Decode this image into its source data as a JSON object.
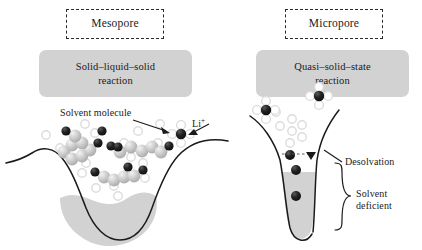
{
  "figure": {
    "colors": {
      "reaction_box_fill": "#d2d2d2",
      "pore_fill": "#d2d2d2",
      "outline": "#1a1a1a",
      "li_ion": "#1a1a1a",
      "solvent_ring": "#e8e8e8",
      "chain_sphere": "#c8c8c8",
      "background": "#ffffff"
    }
  },
  "panels": [
    {
      "id": "mesopore",
      "pore_label": "Mesopore",
      "reaction_label": "Solid–liquid–solid\nreaction",
      "reaction_line1": "Solid–liquid–solid",
      "reaction_line2": "reaction",
      "annotations": [
        {
          "name": "solvent-molecule",
          "text": "Solvent molecule"
        },
        {
          "name": "li-ion",
          "text": "Li",
          "superscript": "+"
        }
      ]
    },
    {
      "id": "micropore",
      "pore_label": "Micropore",
      "reaction_label": "Quasi–solid–state\nreaction",
      "reaction_line1": "Quasi–solid–state",
      "reaction_line2": "reaction",
      "annotations": [
        {
          "name": "desolvation",
          "text": "Desolvation"
        },
        {
          "name": "solvent-deficient-line1",
          "text": "Solvent"
        },
        {
          "name": "solvent-deficient-line2",
          "text": "deficient"
        }
      ]
    }
  ],
  "legend": {
    "solvent_molecule": "Solvent molecule",
    "li_ion": "Li",
    "li_ion_charge": "+",
    "desolvation": "Desolvation",
    "solvent_deficient_line1": "Solvent",
    "solvent_deficient_line2": "deficient"
  },
  "diagram_data": {
    "type": "schematic",
    "description": "Two pore cross-sections comparing solvated Li-ion transport in a wide mesopore with desolvated Li-ion transport in a narrow micropore.",
    "mesopore": {
      "pore_shape": "wide shallow V-shaped depression",
      "contains": [
        "solvated Li+ ions",
        "solvent molecule chains",
        "liquid electrolyte region"
      ],
      "solvent_present": true
    },
    "micropore": {
      "pore_shape": "narrow deep funnel",
      "contains": [
        "solvated Li+ ions above entrance",
        "bare Li+ ions inside"
      ],
      "solvent_present": false,
      "process": "Desolvation at pore mouth"
    }
  }
}
